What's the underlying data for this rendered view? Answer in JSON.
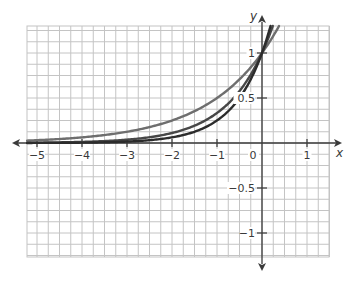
{
  "chart_data": {
    "type": "line",
    "title": "",
    "xlabel": "x",
    "ylabel": "y",
    "xlim": [
      -5.22,
      1.49
    ],
    "ylim": [
      -1.27,
      1.3
    ],
    "grid": true,
    "grid_step_x": 0.25,
    "grid_step_y": 0.125,
    "x_ticks": [
      -5,
      -4,
      -3,
      -2,
      -1,
      1
    ],
    "x_tick_labels": [
      "−5",
      "−4",
      "−3",
      "−2",
      "−1",
      "1"
    ],
    "y_ticks": [
      1,
      0.5,
      -0.5,
      -1
    ],
    "y_tick_labels": [
      "1",
      "0.5",
      "−0.5",
      "−1"
    ],
    "origin_label": "0",
    "legend": null,
    "series": [
      {
        "name": "y = 2^x",
        "base": 2,
        "color": "#6e6e6e",
        "points": [
          [
            -5,
            0.03
          ],
          [
            -4,
            0.06
          ],
          [
            -3,
            0.13
          ],
          [
            -2,
            0.25
          ],
          [
            -1,
            0.5
          ],
          [
            0,
            1
          ],
          [
            0.38,
            1.3
          ]
        ]
      },
      {
        "name": "y = 3^x",
        "base": 3,
        "color": "#474747",
        "points": [
          [
            -5,
            0.004
          ],
          [
            -4,
            0.01
          ],
          [
            -3,
            0.04
          ],
          [
            -2,
            0.11
          ],
          [
            -1,
            0.33
          ],
          [
            0,
            1
          ],
          [
            0.24,
            1.3
          ]
        ]
      },
      {
        "name": "y = 4^x",
        "base": 4,
        "color": "#2c2c2c",
        "points": [
          [
            -5,
            0.001
          ],
          [
            -4,
            0.004
          ],
          [
            -3,
            0.02
          ],
          [
            -2,
            0.06
          ],
          [
            -1,
            0.25
          ],
          [
            0,
            1
          ],
          [
            0.19,
            1.3
          ]
        ]
      }
    ]
  },
  "colors": {
    "grid": "#c4c4c4",
    "axis": "#3a3a3a",
    "background": "#ffffff"
  }
}
